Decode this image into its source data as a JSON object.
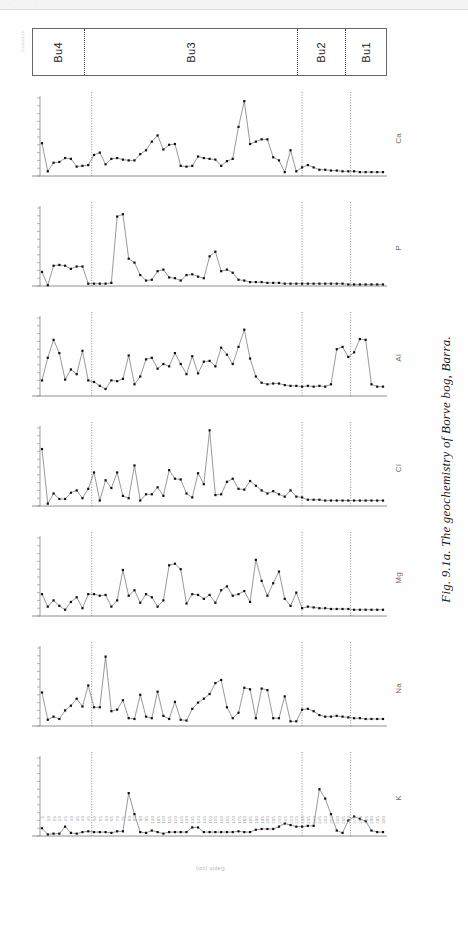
{
  "figure": {
    "caption": "Fig. 9.1a. The geochemistry of Borve bog, Barra.",
    "zonation_axis_title": "Zonation",
    "depth_axis_title": "Depth (cm)"
  },
  "zones": [
    {
      "label": "Bu4",
      "span_fraction": 0.145
    },
    {
      "label": "Bu3",
      "span_fraction": 0.605
    },
    {
      "label": "Bu2",
      "span_fraction": 0.135
    },
    {
      "label": "Bu1",
      "span_fraction": 0.115
    }
  ],
  "zone_boundary_fractions": [
    0.145,
    0.75,
    0.885
  ],
  "depth_ticks": [
    "5",
    "10",
    "15",
    "20",
    "25",
    "30",
    "35",
    "40",
    "45",
    "50",
    "55",
    "60",
    "65",
    "70",
    "75",
    "80",
    "85",
    "90",
    "95",
    "100",
    "105",
    "110",
    "115",
    "120",
    "125",
    "130",
    "135",
    "140",
    "145",
    "150",
    "155",
    "160",
    "165",
    "170",
    "175",
    "180",
    "185",
    "190",
    "195",
    "200",
    "205",
    "210",
    "215",
    "220",
    "225",
    "230",
    "235",
    "240",
    "245",
    "250",
    "255",
    "260",
    "265",
    "270",
    "275",
    "280",
    "285",
    "290",
    "295",
    "300"
  ],
  "chart_data": {
    "type": "line",
    "title": "The geochemistry of Borve bog, Barra",
    "xlabel": "Depth (cm)",
    "ylabel": "",
    "grid": false,
    "legend": "none",
    "x": [
      5,
      10,
      15,
      20,
      25,
      30,
      35,
      40,
      45,
      50,
      55,
      60,
      65,
      70,
      75,
      80,
      85,
      90,
      95,
      100,
      105,
      110,
      115,
      120,
      125,
      130,
      135,
      140,
      145,
      150,
      155,
      160,
      165,
      170,
      175,
      180,
      185,
      190,
      195,
      200,
      205,
      210,
      215,
      220,
      225,
      230,
      235,
      240,
      245,
      250,
      255,
      260,
      265,
      270,
      275,
      280,
      285,
      290,
      295,
      300
    ],
    "zone_boundaries_x": [
      48,
      230,
      272
    ],
    "series": [
      {
        "name": "Ca",
        "ylim": [
          0,
          1.0
        ],
        "values": [
          0.42,
          0.06,
          0.17,
          0.18,
          0.23,
          0.22,
          0.12,
          0.13,
          0.14,
          0.27,
          0.3,
          0.15,
          0.22,
          0.23,
          0.21,
          0.2,
          0.2,
          0.28,
          0.33,
          0.44,
          0.52,
          0.34,
          0.4,
          0.41,
          0.13,
          0.12,
          0.13,
          0.25,
          0.23,
          0.22,
          0.21,
          0.13,
          0.19,
          0.22,
          0.63,
          0.96,
          0.41,
          0.44,
          0.47,
          0.47,
          0.24,
          0.2,
          0.05,
          0.33,
          0.06,
          0.11,
          0.14,
          0.11,
          0.08,
          0.08,
          0.07,
          0.07,
          0.06,
          0.06,
          0.06,
          0.05,
          0.05,
          0.05,
          0.05,
          0.05
        ]
      },
      {
        "name": "P",
        "ylim": [
          0,
          1.0
        ],
        "values": [
          0.18,
          0.01,
          0.26,
          0.27,
          0.26,
          0.22,
          0.25,
          0.25,
          0.03,
          0.03,
          0.03,
          0.03,
          0.04,
          0.89,
          0.92,
          0.35,
          0.3,
          0.14,
          0.07,
          0.08,
          0.19,
          0.21,
          0.11,
          0.1,
          0.07,
          0.14,
          0.15,
          0.12,
          0.1,
          0.38,
          0.44,
          0.19,
          0.21,
          0.17,
          0.08,
          0.07,
          0.05,
          0.05,
          0.05,
          0.04,
          0.04,
          0.04,
          0.03,
          0.03,
          0.03,
          0.03,
          0.03,
          0.03,
          0.03,
          0.03,
          0.03,
          0.03,
          0.03,
          0.02,
          0.02,
          0.02,
          0.02,
          0.02,
          0.02,
          0.02
        ]
      },
      {
        "name": "Al",
        "ylim": [
          0,
          1.0
        ],
        "values": [
          0.2,
          0.49,
          0.72,
          0.55,
          0.21,
          0.34,
          0.28,
          0.58,
          0.2,
          0.18,
          0.13,
          0.09,
          0.2,
          0.19,
          0.22,
          0.52,
          0.15,
          0.25,
          0.47,
          0.49,
          0.35,
          0.41,
          0.38,
          0.55,
          0.41,
          0.28,
          0.51,
          0.29,
          0.44,
          0.45,
          0.38,
          0.62,
          0.53,
          0.41,
          0.63,
          0.85,
          0.48,
          0.25,
          0.17,
          0.15,
          0.16,
          0.16,
          0.14,
          0.13,
          0.13,
          0.12,
          0.13,
          0.12,
          0.13,
          0.12,
          0.15,
          0.6,
          0.63,
          0.5,
          0.56,
          0.73,
          0.72,
          0.15,
          0.12,
          0.12
        ]
      },
      {
        "name": "Cl",
        "ylim": [
          0,
          1.0
        ],
        "values": [
          0.73,
          0.03,
          0.16,
          0.09,
          0.09,
          0.17,
          0.2,
          0.1,
          0.22,
          0.43,
          0.07,
          0.33,
          0.23,
          0.43,
          0.13,
          0.1,
          0.52,
          0.07,
          0.15,
          0.15,
          0.24,
          0.13,
          0.46,
          0.35,
          0.34,
          0.16,
          0.11,
          0.42,
          0.28,
          0.97,
          0.14,
          0.15,
          0.31,
          0.35,
          0.22,
          0.21,
          0.32,
          0.26,
          0.2,
          0.16,
          0.19,
          0.15,
          0.12,
          0.2,
          0.12,
          0.11,
          0.08,
          0.08,
          0.08,
          0.07,
          0.07,
          0.07,
          0.07,
          0.07,
          0.07,
          0.07,
          0.07,
          0.07,
          0.07,
          0.07
        ]
      },
      {
        "name": "Mg",
        "ylim": [
          0,
          1.0
        ],
        "values": [
          0.28,
          0.12,
          0.2,
          0.13,
          0.08,
          0.18,
          0.24,
          0.1,
          0.28,
          0.28,
          0.26,
          0.27,
          0.12,
          0.2,
          0.59,
          0.26,
          0.33,
          0.17,
          0.28,
          0.24,
          0.12,
          0.2,
          0.65,
          0.67,
          0.6,
          0.16,
          0.28,
          0.27,
          0.22,
          0.27,
          0.17,
          0.33,
          0.38,
          0.26,
          0.28,
          0.32,
          0.18,
          0.72,
          0.45,
          0.26,
          0.42,
          0.57,
          0.22,
          0.13,
          0.3,
          0.1,
          0.12,
          0.11,
          0.1,
          0.1,
          0.09,
          0.09,
          0.09,
          0.09,
          0.08,
          0.08,
          0.08,
          0.08,
          0.08,
          0.08
        ]
      },
      {
        "name": "Na",
        "ylim": [
          0,
          1.0
        ],
        "values": [
          0.43,
          0.08,
          0.12,
          0.09,
          0.2,
          0.26,
          0.35,
          0.25,
          0.52,
          0.24,
          0.24,
          0.89,
          0.19,
          0.21,
          0.33,
          0.1,
          0.09,
          0.4,
          0.12,
          0.1,
          0.44,
          0.13,
          0.09,
          0.31,
          0.08,
          0.07,
          0.22,
          0.3,
          0.35,
          0.41,
          0.55,
          0.59,
          0.24,
          0.1,
          0.17,
          0.49,
          0.47,
          0.1,
          0.48,
          0.46,
          0.1,
          0.1,
          0.38,
          0.06,
          0.06,
          0.21,
          0.22,
          0.19,
          0.14,
          0.12,
          0.12,
          0.13,
          0.12,
          0.11,
          0.1,
          0.1,
          0.09,
          0.09,
          0.09,
          0.09
        ]
      },
      {
        "name": "K",
        "ylim": [
          0,
          1.0
        ],
        "values": [
          0.1,
          0.02,
          0.03,
          0.03,
          0.12,
          0.04,
          0.03,
          0.05,
          0.06,
          0.05,
          0.05,
          0.05,
          0.04,
          0.06,
          0.06,
          0.55,
          0.28,
          0.05,
          0.04,
          0.07,
          0.05,
          0.03,
          0.05,
          0.05,
          0.05,
          0.05,
          0.11,
          0.11,
          0.05,
          0.05,
          0.05,
          0.05,
          0.05,
          0.05,
          0.06,
          0.05,
          0.05,
          0.08,
          0.09,
          0.09,
          0.09,
          0.12,
          0.16,
          0.14,
          0.12,
          0.12,
          0.13,
          0.13,
          0.6,
          0.48,
          0.28,
          0.07,
          0.04,
          0.2,
          0.25,
          0.22,
          0.19,
          0.07,
          0.05,
          0.05
        ]
      }
    ]
  },
  "style": {
    "line_color": "#555555",
    "marker_color": "#111111",
    "axis_color": "#777777",
    "zone_divider_color": "#444444"
  }
}
